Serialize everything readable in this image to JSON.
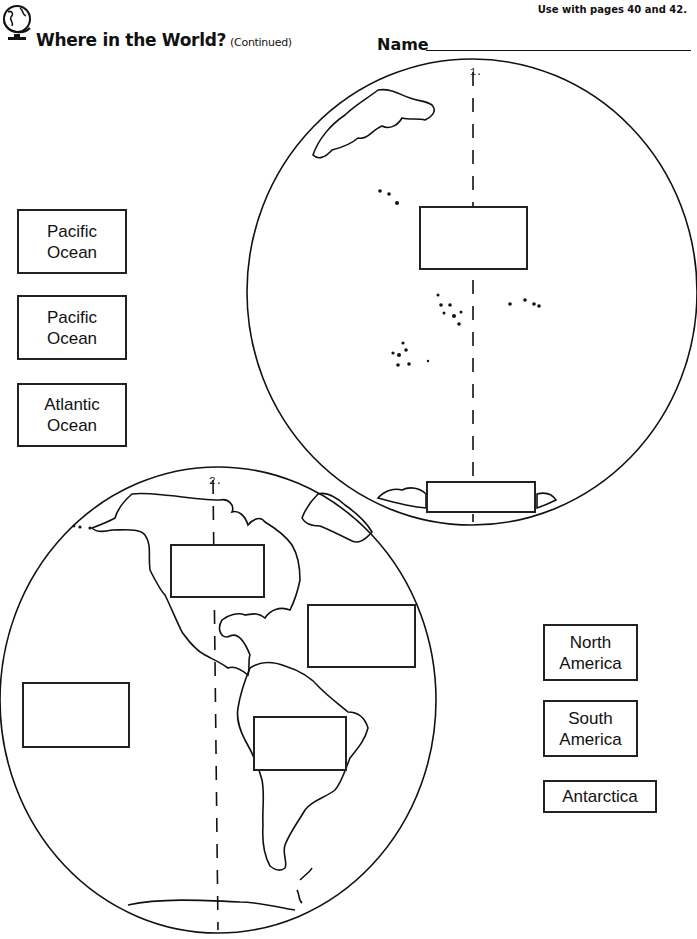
{
  "header": {
    "title": "Where in the World?",
    "subtitle": "(Continued)",
    "use_with": "Use with pages 40 and 42.",
    "name_label": "Name"
  },
  "icons": {
    "logo": "globe-icon"
  },
  "globes": [
    {
      "number": "1.",
      "view": "Pacific hemisphere",
      "answer_boxes": 2
    },
    {
      "number": "2.",
      "view": "Western hemisphere (Americas)",
      "answer_boxes": 4
    }
  ],
  "word_bank_left": [
    {
      "line1": "Pacific",
      "line2": "Ocean"
    },
    {
      "line1": "Pacific",
      "line2": "Ocean"
    },
    {
      "line1": "Atlantic",
      "line2": "Ocean"
    }
  ],
  "word_bank_right": [
    {
      "line1": "North",
      "line2": "America"
    },
    {
      "line1": "South",
      "line2": "America"
    },
    {
      "line1": "Antarctica",
      "line2": ""
    }
  ]
}
